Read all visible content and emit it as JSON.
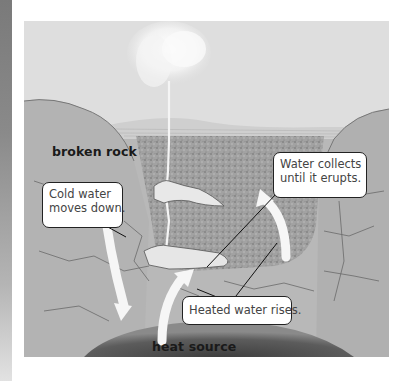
{
  "diagram": {
    "labels": {
      "broken_rock": "broken rock",
      "heat_source": "heat source"
    },
    "callouts": {
      "cold_water": [
        "Cold water",
        "moves down."
      ],
      "water_collects": [
        "Water collects",
        "until it erupts."
      ],
      "heated_water": "Heated water rises."
    },
    "colors": {
      "sky": "#dcdcdc",
      "rock": "#b9b9b9",
      "porous_rock": "#9c9c9c",
      "heat_source": "#5a5a5a",
      "arrow": "#f4f4f4",
      "callout_border": "#222222",
      "label_text": "#1a1a1a"
    }
  }
}
